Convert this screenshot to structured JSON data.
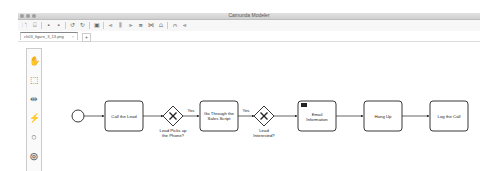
{
  "window": {
    "title": "Camunda Modeler"
  },
  "toolbar": {
    "items": [
      {
        "name": "new-file-icon",
        "glyph": "🗋"
      },
      {
        "name": "open-file-icon",
        "glyph": "⌺"
      },
      {
        "name": "save-icon",
        "glyph": "▪"
      },
      {
        "name": "save-as-icon",
        "glyph": "▪"
      },
      {
        "name": "undo-icon",
        "glyph": "↺"
      },
      {
        "name": "redo-icon",
        "glyph": "↻"
      },
      {
        "name": "export-image-icon",
        "glyph": "▣"
      },
      {
        "name": "align-left-icon",
        "glyph": "⫷"
      },
      {
        "name": "align-center-icon",
        "glyph": "⫼"
      },
      {
        "name": "align-right-icon",
        "glyph": "⫸"
      },
      {
        "name": "align-top-icon",
        "glyph": "⩎"
      },
      {
        "name": "align-middle-icon",
        "glyph": "⋈"
      },
      {
        "name": "align-bottom-icon",
        "glyph": "⩍"
      },
      {
        "name": "distribute-horizontal-icon",
        "glyph": "⩀"
      },
      {
        "name": "distribute-vertical-icon",
        "glyph": "⫷"
      }
    ]
  },
  "tabs": [
    {
      "label": "ch03_figure_3_13.png",
      "close": "○"
    }
  ],
  "tab_add": "+",
  "palette": [
    {
      "name": "hand-tool-icon",
      "glyph": "✋"
    },
    {
      "name": "lasso-tool-icon",
      "glyph": "⬚"
    },
    {
      "name": "space-tool-icon",
      "glyph": "⇹"
    },
    {
      "name": "global-connect-tool-icon",
      "glyph": "⚡"
    },
    {
      "name": "start-event-tool-icon",
      "glyph": "○"
    },
    {
      "name": "intermediate-event-tool-icon",
      "glyph": "◎"
    }
  ],
  "diagram": {
    "start_event": {
      "name": "start-event"
    },
    "tasks": [
      {
        "id": "call-lead",
        "label": [
          "Call the Lead"
        ]
      },
      {
        "id": "sales-script",
        "label": [
          "Go Through the",
          "Sales Script"
        ]
      },
      {
        "id": "email-info",
        "label": [
          "Email",
          "Information"
        ],
        "type": "send"
      },
      {
        "id": "hang-up",
        "label": [
          "Hang Up"
        ]
      },
      {
        "id": "log-call",
        "label": [
          "Log the Call"
        ]
      }
    ],
    "gateways": [
      {
        "id": "lead-picks-up",
        "label": [
          "Lead Picks up",
          "the Phone?"
        ]
      },
      {
        "id": "lead-interested",
        "label": [
          "Lead",
          "Interested?"
        ]
      }
    ],
    "flow_labels": {
      "yes1": "Yes",
      "yes2": "Yes"
    }
  }
}
